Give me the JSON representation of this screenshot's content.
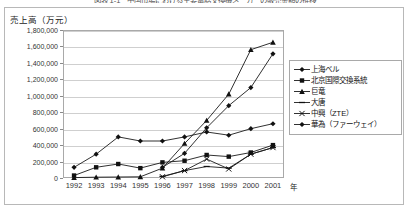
{
  "caption": "図表 1-1　中国市場における主要電話交換機メーカーの販売金額の推移",
  "axis": {
    "y_title": "売上高（万元）",
    "x_title": "年",
    "y_ticks": [
      "1,800,000",
      "1,600,000",
      "1,400,000",
      "1,200,000",
      "1,000,000",
      "800,000",
      "600,000",
      "400,000",
      "200,000",
      "0"
    ],
    "x_ticks": [
      "1992",
      "1993",
      "1994",
      "1995",
      "1996",
      "1997",
      "1998",
      "1999",
      "2000",
      "2001"
    ]
  },
  "legend": {
    "items": [
      {
        "label": "上海ベル",
        "marker": "diamond"
      },
      {
        "label": "北京国際交換系統",
        "marker": "square"
      },
      {
        "label": "巨竜",
        "marker": "triangle"
      },
      {
        "label": "大唐",
        "marker": "dash"
      },
      {
        "label": "中興（ZTE）",
        "marker": "cross"
      },
      {
        "label": "華為（ファーウェイ）",
        "marker": "diamond-filled"
      }
    ]
  },
  "chart_data": {
    "type": "line",
    "title": "図表 1-1　中国市場における主要電話交換機メーカーの販売金額の推移",
    "xlabel": "年",
    "ylabel": "売上高（万元）",
    "ylim": [
      0,
      1800000
    ],
    "ytick_step": 200000,
    "grid": true,
    "legend_position": "right",
    "categories": [
      "1992",
      "1993",
      "1994",
      "1995",
      "1996",
      "1997",
      "1998",
      "1999",
      "2000",
      "2001"
    ],
    "series": [
      {
        "name": "上海ベル",
        "marker": "diamond",
        "values": [
          130000,
          290000,
          500000,
          450000,
          450000,
          500000,
          560000,
          520000,
          600000,
          660000
        ]
      },
      {
        "name": "北京国際交換系統",
        "marker": "square",
        "values": [
          30000,
          130000,
          170000,
          120000,
          190000,
          210000,
          280000,
          260000,
          310000,
          400000
        ]
      },
      {
        "name": "巨竜",
        "marker": "triangle",
        "values": [
          5000,
          10000,
          12000,
          15000,
          120000,
          420000,
          700000,
          1020000,
          1560000,
          1650000
        ]
      },
      {
        "name": "大唐",
        "marker": "dash",
        "values": [
          null,
          null,
          null,
          null,
          20000,
          90000,
          140000,
          120000,
          290000,
          370000
        ]
      },
      {
        "name": "中興（ZTE）",
        "marker": "cross",
        "values": [
          null,
          null,
          null,
          null,
          15000,
          90000,
          230000,
          110000,
          290000,
          370000
        ]
      },
      {
        "name": "華為（ファーウェイ）",
        "marker": "diamond-filled",
        "values": [
          null,
          null,
          null,
          null,
          130000,
          300000,
          610000,
          880000,
          1100000,
          1510000
        ]
      }
    ]
  }
}
